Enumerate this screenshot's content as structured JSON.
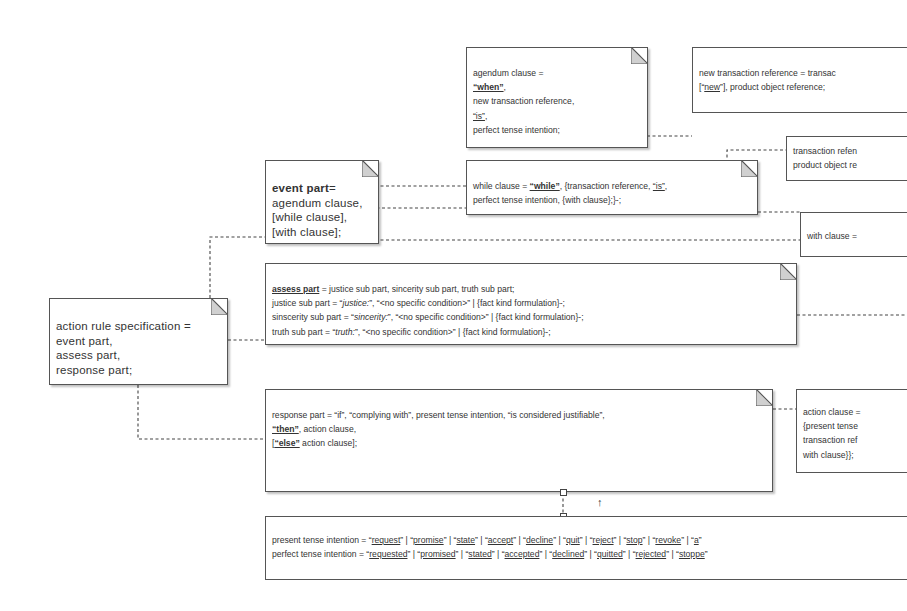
{
  "diagram": {
    "action_rule": {
      "lines": [
        "action rule specification =",
        "event part,",
        "assess part,",
        "response part;"
      ]
    },
    "event_part": {
      "head": "event part",
      "head_suffix": "=",
      "lines": [
        "agendum clause,",
        "[while clause],",
        "[with clause];"
      ]
    },
    "agendum_clause": {
      "line1": "agendum clause =",
      "when": "“when”",
      "when_suffix": ",",
      "line3": "new transaction reference,",
      "is": "“is”",
      "is_suffix": ",",
      "line5": "perfect tense intention;"
    },
    "new_transaction_reference": {
      "line1": "new transaction reference = transac",
      "l2_prefix": "[“",
      "new": "new",
      "l2_suffix": "”], product object reference;"
    },
    "transaction_reference": {
      "line1": "transaction refen",
      "line2": "product object re"
    },
    "while_clause": {
      "prefix": "while clause = ",
      "while": "“while”",
      "mid": ", {transaction reference, ",
      "is": "“is”",
      "end": ",",
      "line2": "perfect tense intention, {with clause};}-;"
    },
    "with_clause": {
      "line1": "with clause ="
    },
    "assess_part": {
      "head": "assess part",
      "head_rest": " = justice sub part, sincerity sub part, truth sub part;",
      "justice_prefix": "justice sub part = “",
      "justice_kw": "justice:",
      "justice_rest": "”, “<no specific condition>” | {fact kind formulation}-;",
      "sincerity_prefix": "sinscerity sub part = “",
      "sincerity_kw": "sincerity:",
      "sincerity_rest": "”, “<no specific condition>” | {fact kind formulation}-;",
      "truth_prefix": "truth sub part = “",
      "truth_kw": "truth:",
      "truth_rest": "”, “<no specific condition>” | {fact kind formulation}-;"
    },
    "response_part": {
      "line1": "response part = “if”, “complying with”, present tense intention, “is considered justifiable”,",
      "then": "“then”",
      "then_rest": ", action clause,",
      "else_prefix": "[",
      "else": "“else”",
      "else_rest": " action clause];"
    },
    "action_clause": {
      "lines": [
        "action clause =",
        "{present tense",
        "transaction ref",
        "with clause}};"
      ]
    },
    "intentions": {
      "present_prefix": "present tense intention = ",
      "present": [
        "request",
        "promise",
        "state",
        "accept",
        "decline",
        "quit",
        "reject",
        "stop",
        "revoke",
        "a"
      ],
      "perfect_prefix": "perfect tense intention = ",
      "perfect": [
        "requested",
        "promised",
        "stated",
        "accepted",
        "declined",
        "quitted",
        "rejected",
        "stoppe"
      ]
    },
    "arrow_glyph": "↑"
  }
}
